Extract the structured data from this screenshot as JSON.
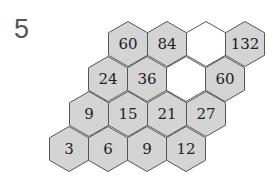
{
  "problem_number": "5",
  "colors": {
    "filled": "#d4d4d4",
    "empty": "#ffffff",
    "stroke": "#555555"
  },
  "hexagons": [
    {
      "row": 1,
      "col": 1,
      "label": "60",
      "cx": 128,
      "cy": 44
    },
    {
      "row": 1,
      "col": 2,
      "label": "84",
      "cx": 167,
      "cy": 44
    },
    {
      "row": 1,
      "col": 3,
      "label": "",
      "cx": 206,
      "cy": 44
    },
    {
      "row": 1,
      "col": 4,
      "label": "132",
      "cx": 245,
      "cy": 44
    },
    {
      "row": 2,
      "col": 1,
      "label": "24",
      "cx": 108,
      "cy": 79
    },
    {
      "row": 2,
      "col": 2,
      "label": "36",
      "cx": 147,
      "cy": 79
    },
    {
      "row": 2,
      "col": 3,
      "label": "",
      "cx": 186,
      "cy": 79
    },
    {
      "row": 2,
      "col": 4,
      "label": "60",
      "cx": 225,
      "cy": 79
    },
    {
      "row": 3,
      "col": 1,
      "label": "9",
      "cx": 89,
      "cy": 114
    },
    {
      "row": 3,
      "col": 2,
      "label": "15",
      "cx": 128,
      "cy": 114
    },
    {
      "row": 3,
      "col": 3,
      "label": "21",
      "cx": 167,
      "cy": 114
    },
    {
      "row": 3,
      "col": 4,
      "label": "27",
      "cx": 206,
      "cy": 114
    },
    {
      "row": 4,
      "col": 1,
      "label": "3",
      "cx": 69,
      "cy": 149
    },
    {
      "row": 4,
      "col": 2,
      "label": "6",
      "cx": 108,
      "cy": 149
    },
    {
      "row": 4,
      "col": 3,
      "label": "9",
      "cx": 147,
      "cy": 149
    },
    {
      "row": 4,
      "col": 4,
      "label": "12",
      "cx": 186,
      "cy": 149
    }
  ]
}
